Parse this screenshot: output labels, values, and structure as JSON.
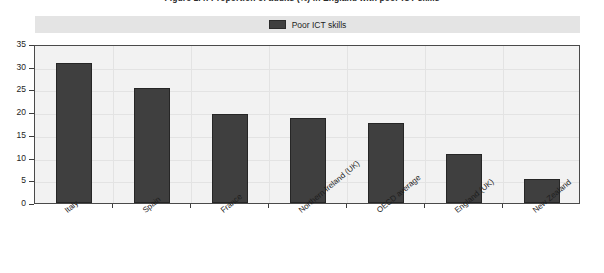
{
  "chart_data": {
    "type": "bar",
    "title": "Figure 1.4: Proportion of adults (%) in England with poor ICT skills",
    "xlabel": "",
    "ylabel": "",
    "ylim": [
      0,
      35
    ],
    "ystep": 5,
    "ytick_labels": [
      "0",
      "5",
      "10",
      "15",
      "20",
      "25",
      "30",
      "35"
    ],
    "grid": true,
    "legend_position": "top",
    "series": [
      {
        "name": "Poor ICT skills",
        "color": "#3f3f3f",
        "values": [
          30.8,
          25.4,
          19.6,
          18.7,
          17.6,
          10.7,
          5.3
        ]
      }
    ],
    "categories": [
      "Italy",
      "Spain",
      "France",
      "Northern Ireland (UK)",
      "OECD average",
      "England (UK)",
      "New Zealand"
    ]
  },
  "legend": {
    "entries": [
      {
        "label": "Poor ICT skills",
        "color": "#3f3f3f"
      }
    ]
  }
}
